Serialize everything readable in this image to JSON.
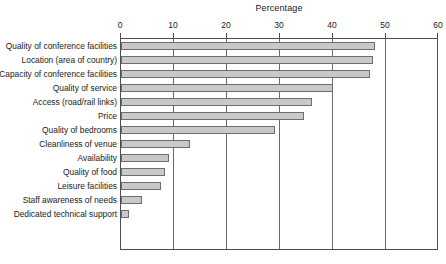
{
  "chart_data": {
    "type": "bar",
    "orientation": "horizontal",
    "title": "Percentage",
    "xlabel": "Percentage",
    "ylabel": "",
    "xlim": [
      0,
      60
    ],
    "xticks": [
      0,
      10,
      20,
      30,
      40,
      50,
      60
    ],
    "grid": true,
    "grid_axis": "x",
    "legend": null,
    "axis_position": "top",
    "categories": [
      "Quality of conference facilities",
      "Location (area of country)",
      "Capacity of conference facilities",
      "Quality of service",
      "Access (road/rail links)",
      "Price",
      "Quality of bedrooms",
      "Cleanliness of venue",
      "Availability",
      "Quality of food",
      "Leisure facilities",
      "Staff awareness of needs",
      "Dedicated technical support"
    ],
    "values": [
      48,
      47.5,
      47,
      40,
      36,
      34.5,
      29,
      13,
      9,
      8.3,
      7.5,
      4,
      1.5
    ],
    "bar_color": "#c9c9c9",
    "bar_edge_color": "#6e6e6e"
  }
}
